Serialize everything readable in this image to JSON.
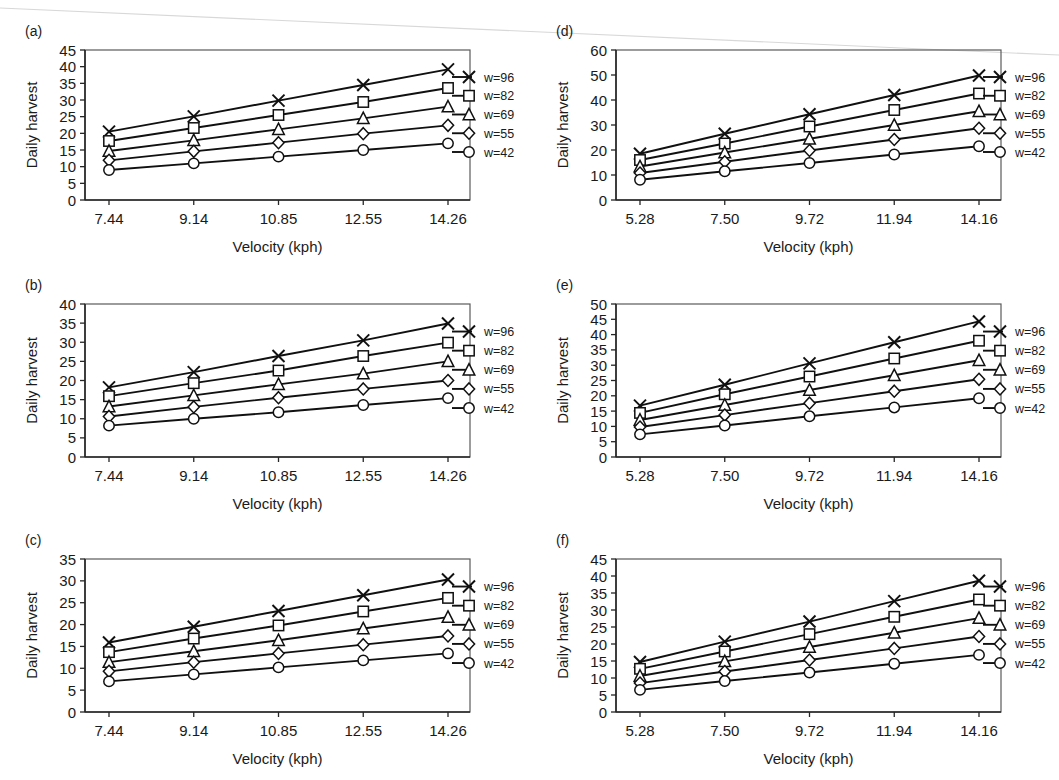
{
  "figure": {
    "panel_labels": [
      "(a)",
      "(b)",
      "(c)",
      "(d)",
      "(e)",
      "(f)"
    ],
    "shared_ylabel": "Daily harvest",
    "shared_xlabel": "Velocity (kph)",
    "line_color": "#101010",
    "marker_fill": "#ffffff",
    "axis_color": "#262626"
  },
  "legend": {
    "entries": [
      {
        "label": "w=96",
        "marker": "x-marker-icon"
      },
      {
        "label": "w=82",
        "marker": "square-marker-icon"
      },
      {
        "label": "w=69",
        "marker": "triangle-marker-icon"
      },
      {
        "label": "w=55",
        "marker": "diamond-marker-icon"
      },
      {
        "label": "w=42",
        "marker": "circle-marker-icon"
      }
    ]
  },
  "chart_data": [
    {
      "id": "panel-a",
      "type": "line",
      "title": "(a)",
      "xlabel": "Velocity (kph)",
      "ylabel": "Daily harvest",
      "categories": [
        "7.44",
        "9.14",
        "10.85",
        "12.55",
        "14.26"
      ],
      "x": [
        7.44,
        9.14,
        10.85,
        12.55,
        14.26
      ],
      "ylim": [
        0,
        45
      ],
      "yticks": [
        0,
        5,
        10,
        15,
        20,
        25,
        30,
        35,
        40,
        45
      ],
      "grid": false,
      "legend_position": "right",
      "series": [
        {
          "name": "w=96",
          "marker": "x",
          "values": [
            20.5,
            25.1,
            29.8,
            34.5,
            39.2
          ]
        },
        {
          "name": "w=82",
          "marker": "square",
          "values": [
            17.7,
            21.6,
            25.5,
            29.4,
            33.6
          ]
        },
        {
          "name": "w=69",
          "marker": "triangle",
          "values": [
            14.7,
            17.9,
            21.2,
            24.5,
            28.0
          ]
        },
        {
          "name": "w=55",
          "marker": "diamond",
          "values": [
            11.9,
            14.6,
            17.2,
            19.9,
            22.4
          ]
        },
        {
          "name": "w=42",
          "marker": "circle",
          "values": [
            9.0,
            11.0,
            13.0,
            15.0,
            17.0
          ]
        }
      ]
    },
    {
      "id": "panel-b",
      "type": "line",
      "title": "(b)",
      "xlabel": "Velocity (kph)",
      "ylabel": "Daily harvest",
      "categories": [
        "7.44",
        "9.14",
        "10.85",
        "12.55",
        "14.26"
      ],
      "x": [
        7.44,
        9.14,
        10.85,
        12.55,
        14.26
      ],
      "ylim": [
        0,
        40
      ],
      "yticks": [
        0,
        5,
        10,
        15,
        20,
        25,
        30,
        35,
        40
      ],
      "grid": false,
      "legend_position": "right",
      "series": [
        {
          "name": "w=96",
          "marker": "x",
          "values": [
            18.2,
            22.2,
            26.4,
            30.5,
            34.9
          ]
        },
        {
          "name": "w=82",
          "marker": "square",
          "values": [
            15.9,
            19.3,
            22.6,
            26.4,
            29.9
          ]
        },
        {
          "name": "w=69",
          "marker": "triangle",
          "values": [
            13.2,
            16.1,
            19.0,
            21.8,
            25.0
          ]
        },
        {
          "name": "w=55",
          "marker": "diamond",
          "values": [
            10.6,
            13.1,
            15.5,
            17.8,
            20.0
          ]
        },
        {
          "name": "w=42",
          "marker": "circle",
          "values": [
            8.2,
            10.0,
            11.7,
            13.6,
            15.4
          ]
        }
      ]
    },
    {
      "id": "panel-c",
      "type": "line",
      "title": "(c)",
      "xlabel": "Velocity (kph)",
      "ylabel": "Daily harvest",
      "categories": [
        "7.44",
        "9.14",
        "10.85",
        "12.55",
        "14.26"
      ],
      "x": [
        7.44,
        9.14,
        10.85,
        12.55,
        14.26
      ],
      "ylim": [
        0,
        35
      ],
      "yticks": [
        0,
        5,
        10,
        15,
        20,
        25,
        30,
        35
      ],
      "grid": false,
      "legend_position": "right",
      "series": [
        {
          "name": "w=96",
          "marker": "x",
          "values": [
            15.9,
            19.5,
            23.1,
            26.7,
            30.3
          ]
        },
        {
          "name": "w=82",
          "marker": "square",
          "values": [
            13.7,
            16.8,
            19.8,
            23.0,
            26.1
          ]
        },
        {
          "name": "w=69",
          "marker": "triangle",
          "values": [
            11.4,
            13.9,
            16.4,
            19.1,
            21.7
          ]
        },
        {
          "name": "w=55",
          "marker": "diamond",
          "values": [
            9.3,
            11.4,
            13.4,
            15.4,
            17.4
          ]
        },
        {
          "name": "w=42",
          "marker": "circle",
          "values": [
            7.0,
            8.6,
            10.2,
            11.8,
            13.4
          ]
        }
      ]
    },
    {
      "id": "panel-d",
      "type": "line",
      "title": "(d)",
      "xlabel": "Velocity (kph)",
      "ylabel": "Daily harvest",
      "categories": [
        "5.28",
        "7.50",
        "9.72",
        "11.94",
        "14.16"
      ],
      "x": [
        5.28,
        7.5,
        9.72,
        11.94,
        14.16
      ],
      "ylim": [
        0,
        60
      ],
      "yticks": [
        0,
        10,
        20,
        30,
        40,
        50,
        60
      ],
      "grid": false,
      "legend_position": "right",
      "series": [
        {
          "name": "w=96",
          "marker": "x",
          "values": [
            18.5,
            26.5,
            34.3,
            42.0,
            49.8
          ]
        },
        {
          "name": "w=82",
          "marker": "square",
          "values": [
            16.0,
            22.6,
            29.4,
            36.0,
            42.6
          ]
        },
        {
          "name": "w=69",
          "marker": "triangle",
          "values": [
            13.4,
            19.0,
            24.5,
            30.0,
            35.5
          ]
        },
        {
          "name": "w=55",
          "marker": "diamond",
          "values": [
            10.8,
            15.3,
            19.8,
            24.2,
            28.7
          ]
        },
        {
          "name": "w=42",
          "marker": "circle",
          "values": [
            8.1,
            11.5,
            14.8,
            18.2,
            21.5
          ]
        }
      ]
    },
    {
      "id": "panel-e",
      "type": "line",
      "title": "(e)",
      "xlabel": "Velocity (kph)",
      "ylabel": "Daily harvest",
      "categories": [
        "5.28",
        "7.50",
        "9.72",
        "11.94",
        "14.16"
      ],
      "x": [
        5.28,
        7.5,
        9.72,
        11.94,
        14.16
      ],
      "ylim": [
        0,
        50
      ],
      "yticks": [
        0,
        5,
        10,
        15,
        20,
        25,
        30,
        35,
        40,
        45,
        50
      ],
      "grid": false,
      "legend_position": "right",
      "series": [
        {
          "name": "w=96",
          "marker": "x",
          "values": [
            16.8,
            23.6,
            30.6,
            37.5,
            44.3
          ]
        },
        {
          "name": "w=82",
          "marker": "square",
          "values": [
            14.4,
            20.5,
            26.3,
            32.2,
            38.0
          ]
        },
        {
          "name": "w=69",
          "marker": "triangle",
          "values": [
            12.1,
            17.0,
            21.9,
            26.7,
            31.6
          ]
        },
        {
          "name": "w=55",
          "marker": "diamond",
          "values": [
            9.8,
            13.7,
            17.6,
            21.5,
            25.4
          ]
        },
        {
          "name": "w=42",
          "marker": "circle",
          "values": [
            7.4,
            10.3,
            13.3,
            16.2,
            19.2
          ]
        }
      ]
    },
    {
      "id": "panel-f",
      "type": "line",
      "title": "(f)",
      "xlabel": "Velocity (kph)",
      "ylabel": "Daily harvest",
      "categories": [
        "5.28",
        "7.50",
        "9.72",
        "11.94",
        "14.16"
      ],
      "x": [
        5.28,
        7.5,
        9.72,
        11.94,
        14.16
      ],
      "ylim": [
        0,
        45
      ],
      "yticks": [
        0,
        5,
        10,
        15,
        20,
        25,
        30,
        35,
        40,
        45
      ],
      "grid": false,
      "legend_position": "right",
      "series": [
        {
          "name": "w=96",
          "marker": "x",
          "values": [
            14.7,
            20.7,
            26.6,
            32.6,
            38.6
          ]
        },
        {
          "name": "w=82",
          "marker": "square",
          "values": [
            12.7,
            17.8,
            22.9,
            28.0,
            33.1
          ]
        },
        {
          "name": "w=69",
          "marker": "triangle",
          "values": [
            10.6,
            14.9,
            19.1,
            23.3,
            27.6
          ]
        },
        {
          "name": "w=55",
          "marker": "diamond",
          "values": [
            8.5,
            11.9,
            15.3,
            18.7,
            22.2
          ]
        },
        {
          "name": "w=42",
          "marker": "circle",
          "values": [
            6.5,
            9.1,
            11.6,
            14.2,
            16.8
          ]
        }
      ]
    }
  ]
}
